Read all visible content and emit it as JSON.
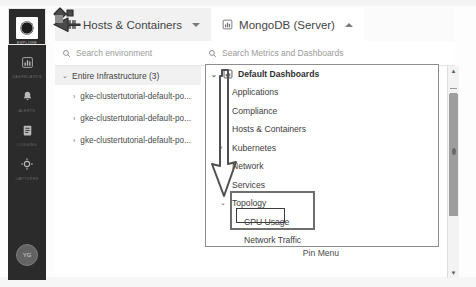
{
  "app": {
    "title": "Infrastructure Explore"
  },
  "rail": {
    "items": [
      {
        "label": "Explore",
        "icon": "compass-icon",
        "active": true
      },
      {
        "label": "Dashboards",
        "icon": "bar-chart-icon",
        "active": false
      },
      {
        "label": "Alerts",
        "icon": "bell-icon",
        "active": false
      },
      {
        "label": "Logging",
        "icon": "document-icon",
        "active": false
      },
      {
        "label": "Captures",
        "icon": "target-icon",
        "active": false
      }
    ],
    "avatar_initials": "YG"
  },
  "tabs": [
    {
      "label": "Hosts & Containers",
      "icon": "grid-icon",
      "caret": "down",
      "state": "secondary"
    },
    {
      "label": "MongoDB (Server)",
      "icon": "bar-chart-icon",
      "caret": "up",
      "state": "active"
    }
  ],
  "left_panel": {
    "search": {
      "placeholder": "Search environment",
      "icon": "search-icon"
    },
    "tree": {
      "root": {
        "label": "Entire Infrastructure (3)",
        "chevron": "expanded"
      },
      "children": [
        {
          "label": "gke-clustertutorial-default-po...",
          "chevron": "collapsed"
        },
        {
          "label": "gke-clustertutorial-default-po...",
          "chevron": "collapsed"
        },
        {
          "label": "gke-clustertutorial-default-po...",
          "chevron": "collapsed"
        }
      ]
    }
  },
  "right_panel": {
    "search": {
      "placeholder": "Search Metrics and Dashboards",
      "icon": "search-icon"
    },
    "menu_header": {
      "label": "Default Dashboards",
      "icon": "bar-chart-icon",
      "chevron": "expanded"
    },
    "menu_items": [
      {
        "label": "Applications",
        "chevron": "",
        "level": 1
      },
      {
        "label": "Compliance",
        "chevron": "",
        "level": 1
      },
      {
        "label": "Hosts & Containers",
        "chevron": "",
        "level": 1
      },
      {
        "label": "Kubernetes",
        "chevron": "collapsed",
        "level": 1
      },
      {
        "label": "Network",
        "chevron": "",
        "level": 1
      },
      {
        "label": "Services",
        "chevron": "",
        "level": 1
      },
      {
        "label": "Topology",
        "chevron": "expanded",
        "level": 1
      },
      {
        "label": "CPU Usage",
        "chevron": "",
        "level": 2
      },
      {
        "label": "Network Traffic",
        "chevron": "",
        "level": 2
      }
    ],
    "pin_menu_label": "Pin Menu"
  },
  "annotations": {
    "boxes": [
      {
        "name": "topology-group-highlight"
      },
      {
        "name": "cpu-usage-highlight"
      }
    ],
    "arrows": [
      {
        "name": "explore-pointer-arrow"
      },
      {
        "name": "dashboards-to-topology-arrow"
      }
    ]
  },
  "scrollbar": {
    "up_arrow": "▲",
    "down_arrow": "▼"
  },
  "colors": {
    "rail_bg": "#2b2b2b",
    "annotation": "#6e6e6e",
    "accent_text": "#3b3b3b"
  }
}
